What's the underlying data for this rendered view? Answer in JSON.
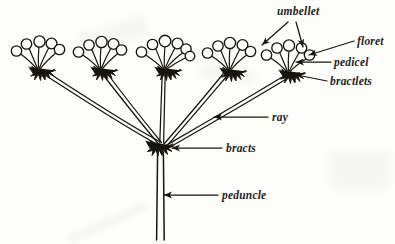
{
  "figure": {
    "ink_color": "#17150f",
    "background_color": "#fdfdfc"
  },
  "labels": {
    "umbellet": "umbellet",
    "floret": "floret",
    "pedicel": "pedicel",
    "bractlets": "bractlets",
    "ray": "ray",
    "bracts": "bracts",
    "peduncle": "peduncle"
  },
  "structure": {
    "umbellet_count": 5,
    "ray_count": 5,
    "floret_counts": [
      5,
      5,
      6,
      5,
      5
    ],
    "peduncle_count": 1,
    "bracts_node": "center",
    "umbellets": [
      {
        "name": "umbellet-1",
        "x": 36,
        "y": 68,
        "florets": 5
      },
      {
        "name": "umbellet-2",
        "x": 98,
        "y": 68,
        "florets": 5
      },
      {
        "name": "umbellet-3",
        "x": 166,
        "y": 68,
        "florets": 6
      },
      {
        "name": "umbellet-4",
        "x": 231,
        "y": 68,
        "florets": 5
      },
      {
        "name": "umbellet-5",
        "x": 290,
        "y": 70,
        "florets": 5
      }
    ],
    "bracts_point": {
      "x": 161,
      "y": 148
    },
    "peduncle_base": {
      "x": 161,
      "y": 240
    }
  },
  "leaders": {
    "umbellet_arrow_a": {
      "from_x": 288,
      "from_y": 22,
      "to_x": 262,
      "to_y": 46
    },
    "umbellet_arrow_b": {
      "from_x": 296,
      "from_y": 22,
      "to_x": 303,
      "to_y": 48
    },
    "floret_arrow": {
      "from_x": 354,
      "from_y": 41,
      "to_x": 308,
      "to_y": 55
    },
    "pedicel_arrow": {
      "from_x": 331,
      "from_y": 62,
      "to_x": 296,
      "to_y": 62
    },
    "bractlets_arrow": {
      "from_x": 327,
      "from_y": 81,
      "to_x": 292,
      "to_y": 74
    },
    "ray_arrow": {
      "from_x": 268,
      "from_y": 117,
      "to_x": 216,
      "to_y": 117
    },
    "bracts_arrow": {
      "from_x": 222,
      "from_y": 148,
      "to_x": 172,
      "to_y": 148
    },
    "peduncle_arrow": {
      "from_x": 218,
      "from_y": 195,
      "to_x": 166,
      "to_y": 195
    }
  }
}
